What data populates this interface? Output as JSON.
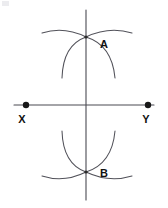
{
  "figure": {
    "canvas": {
      "width": 168,
      "height": 208,
      "background": "#ffffff"
    },
    "colors": {
      "line": "#4a4a52",
      "arc": "#52525a",
      "dot": "#171717",
      "label": "#111111"
    }
  },
  "labels": {
    "point_a": "A",
    "point_b": "B",
    "point_x": "X",
    "point_y": "Y"
  },
  "geometry": {
    "baseline": {
      "name": "line-xy",
      "x1": 14,
      "y1": 105,
      "x2": 154,
      "y2": 105
    },
    "perpendicular": {
      "name": "line-ab",
      "x1": 86,
      "y1": 10,
      "x2": 86,
      "y2": 200
    },
    "endpoints": [
      {
        "id": "x",
        "cx": 26,
        "cy": 105,
        "r": 3.2
      },
      {
        "id": "y",
        "cx": 148,
        "cy": 105,
        "r": 3.2
      }
    ],
    "intersections": [
      {
        "id": "a",
        "cx": 86,
        "cy": 37,
        "r": 1.6
      },
      {
        "id": "b",
        "cx": 86,
        "cy": 172,
        "r": 1.6
      }
    ],
    "arcs": [
      {
        "id": "upper-shallow-left",
        "d": "M 42 33 Q 64 26 86 37"
      },
      {
        "id": "upper-shallow-right",
        "d": "M 132 33 Q 109 26 86 37"
      },
      {
        "id": "upper-steep-left",
        "d": "M 62 78 Q 63 45 86 37"
      },
      {
        "id": "upper-steep-right",
        "d": "M 115 78 Q 112 45 86 37"
      },
      {
        "id": "lower-shallow-left",
        "d": "M 42 176 Q 64 183 86 172"
      },
      {
        "id": "lower-shallow-right",
        "d": "M 132 176 Q 109 183 86 172"
      },
      {
        "id": "lower-steep-left",
        "d": "M 62 131 Q 63 164 86 172"
      },
      {
        "id": "lower-steep-right",
        "d": "M 115 131 Q 112 164 86 172"
      }
    ],
    "label_positions": {
      "a": {
        "x": 100,
        "y": 45
      },
      "b": {
        "x": 100,
        "y": 174
      },
      "x": {
        "x": 22,
        "y": 120
      },
      "y": {
        "x": 144,
        "y": 120
      }
    }
  }
}
